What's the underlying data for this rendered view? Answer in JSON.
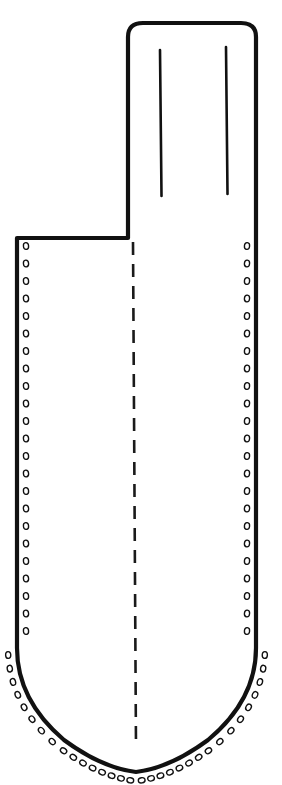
{
  "figure": {
    "caption": "",
    "background_color": "#ffffff",
    "ink_color": "#111111",
    "canvas": {
      "width": 282,
      "height": 785
    }
  },
  "geometry": {
    "tab": {
      "name": "belt-tab",
      "left_x": 128,
      "right_x": 256,
      "top_y": 23,
      "corner_radius": 14,
      "bottom_y": 238,
      "edge_notch_y": 100
    },
    "body": {
      "name": "sheath-body",
      "left_x": 17,
      "right_x": 256,
      "shoulder_y": 238,
      "straight_bottom_y": 648,
      "point_x": 136,
      "point_y": 772
    },
    "slits": [
      {
        "name": "belt-slit-left",
        "x": 160,
        "y_top": 50,
        "y_bottom": 196
      },
      {
        "name": "belt-slit-right",
        "x": 226,
        "y_top": 47,
        "y_bottom": 194
      }
    ],
    "fold_line": {
      "name": "centre-fold-line",
      "x": 133,
      "y_top": 242,
      "y_bottom": 748,
      "dash_length": 13,
      "gap_length": 9
    },
    "stitch_holes": {
      "inset_from_edge": 9,
      "spacing": 17.5,
      "radius_x": 2.6,
      "radius_y": 3.4,
      "left_edge_count": 24,
      "right_edge_count": 24,
      "bottom_left_curve_count": 16,
      "bottom_right_curve_count": 16,
      "total": 80
    }
  },
  "outline_path": "M 128 37 Q 128 23 143 23 L 241 23 Q 256 23 256 37 L 256 648 Q 256 700 208 740 Q 170 768 136 772 Q 102 768 64 740 Q 17 700 17 648 L 17 238 L 128 238 Z",
  "labels": {
    "figure_label": "",
    "notes": ""
  }
}
